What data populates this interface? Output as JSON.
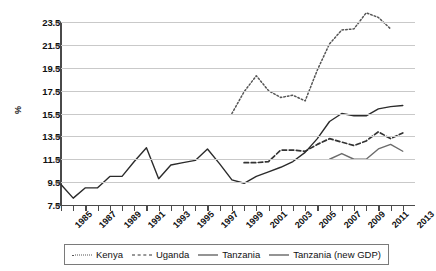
{
  "chart_data": {
    "type": "line",
    "title": "",
    "xlabel": "",
    "ylabel": "%",
    "ylim": [
      7.5,
      23.5
    ],
    "yticks": [
      7.5,
      9.5,
      11.5,
      13.5,
      15.5,
      17.5,
      19.5,
      21.5,
      23.5
    ],
    "ytick_labels": [
      "7.5",
      "9.5",
      "11.5",
      "13.5",
      "15.5",
      "17.5",
      "19.5",
      "21.5",
      "23.5"
    ],
    "xlim": [
      1985,
      2014
    ],
    "xticks": [
      1985,
      1986,
      1987,
      1988,
      1989,
      1990,
      1991,
      1992,
      1993,
      1994,
      1995,
      1996,
      1997,
      1998,
      1999,
      2000,
      2001,
      2002,
      2003,
      2004,
      2005,
      2006,
      2007,
      2008,
      2009,
      2010,
      2011,
      2012,
      2013
    ],
    "xtick_labels": [
      "1985",
      "",
      "1987",
      "",
      "1989",
      "",
      "1991",
      "",
      "1993",
      "",
      "1995",
      "",
      "1997",
      "",
      "1999",
      "",
      "2001",
      "",
      "2003",
      "",
      "2005",
      "",
      "2007",
      "",
      "2009",
      "",
      "2011",
      "",
      "2013"
    ],
    "grid": "horizontal",
    "legend_position": "bottom",
    "series": [
      {
        "name": "Kenya",
        "style": "dotted",
        "color": "#555555",
        "x": [
          1999,
          2000,
          2001,
          2002,
          2003,
          2004,
          2005,
          2006,
          2007,
          2008,
          2009,
          2010,
          2011,
          2012
        ],
        "values": [
          15.5,
          17.4,
          18.8,
          17.5,
          16.9,
          17.1,
          16.6,
          19.3,
          21.6,
          22.8,
          22.9,
          24.3,
          23.9,
          22.9
        ]
      },
      {
        "name": "Uganda",
        "style": "dashed",
        "color": "#333333",
        "x": [
          2000,
          2001,
          2002,
          2003,
          2004,
          2005,
          2006,
          2007,
          2008,
          2009,
          2010,
          2011,
          2012,
          2013
        ],
        "values": [
          11.2,
          11.2,
          11.3,
          12.3,
          12.3,
          12.2,
          12.8,
          13.3,
          13.0,
          12.7,
          13.1,
          13.9,
          13.3,
          13.8
        ]
      },
      {
        "name": "Tanzania",
        "style": "solid",
        "color": "#2b2b2b",
        "x": [
          1985,
          1986,
          1987,
          1988,
          1989,
          1990,
          1991,
          1992,
          1993,
          1994,
          1995,
          1996,
          1997,
          1998,
          1999,
          2000,
          2001,
          2002,
          2003,
          2004,
          2005,
          2006,
          2007,
          2008,
          2009,
          2010,
          2011,
          2012,
          2013
        ],
        "values": [
          9.3,
          8.1,
          9.0,
          9.0,
          10.0,
          10.0,
          11.3,
          12.5,
          9.8,
          11.0,
          11.2,
          11.4,
          12.4,
          11.1,
          9.7,
          9.4,
          10.0,
          10.4,
          10.8,
          11.3,
          12.1,
          13.3,
          14.8,
          15.5,
          15.3,
          15.3,
          15.9,
          16.1,
          16.2
        ]
      },
      {
        "name": "Tanzania (new GDP)",
        "style": "solid",
        "color": "#6b6b6b",
        "x": [
          2007,
          2008,
          2009,
          2010,
          2011,
          2012,
          2013
        ],
        "values": [
          11.5,
          12.0,
          11.5,
          11.5,
          12.4,
          12.8,
          12.2
        ]
      }
    ]
  },
  "legend": {
    "items": [
      {
        "label": "Kenya",
        "swatch": "dotted-line-swatch"
      },
      {
        "label": "Uganda",
        "swatch": "dashed-line-swatch"
      },
      {
        "label": "Tanzania",
        "swatch": "solid-line-swatch"
      },
      {
        "label": "Tanzania (new GDP)",
        "swatch": "solid-line-swatch"
      }
    ]
  }
}
